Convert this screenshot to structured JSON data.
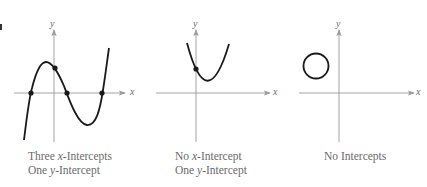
{
  "figure": {
    "panels": [
      {
        "id": "three-x-one-y",
        "axis_labels": {
          "x": "x",
          "y": "y"
        },
        "caption": {
          "line1": {
            "pre": "Three ",
            "var": "x",
            "post": "-Intercepts"
          },
          "line2": {
            "pre": "One ",
            "var": "y",
            "post": "-Intercept"
          }
        },
        "curve_type": "cubic",
        "x_intercepts": 3,
        "y_intercepts": 1
      },
      {
        "id": "no-x-one-y",
        "axis_labels": {
          "x": "x",
          "y": "y"
        },
        "caption": {
          "line1": {
            "pre": "No ",
            "var": "x",
            "post": "-Intercept"
          },
          "line2": {
            "pre": "One ",
            "var": "y",
            "post": "-Intercept"
          }
        },
        "curve_type": "parabola",
        "x_intercepts": 0,
        "y_intercepts": 1
      },
      {
        "id": "no-intercepts",
        "axis_labels": {
          "x": "x",
          "y": "y"
        },
        "caption": {
          "line1": {
            "pre": "No Intercepts",
            "var": "",
            "post": ""
          }
        },
        "curve_type": "circle",
        "x_intercepts": 0,
        "y_intercepts": 0
      }
    ],
    "colors": {
      "axis": "#9a9a9a",
      "curve": "#1a1a1a",
      "text": "#6a6a6a"
    }
  }
}
